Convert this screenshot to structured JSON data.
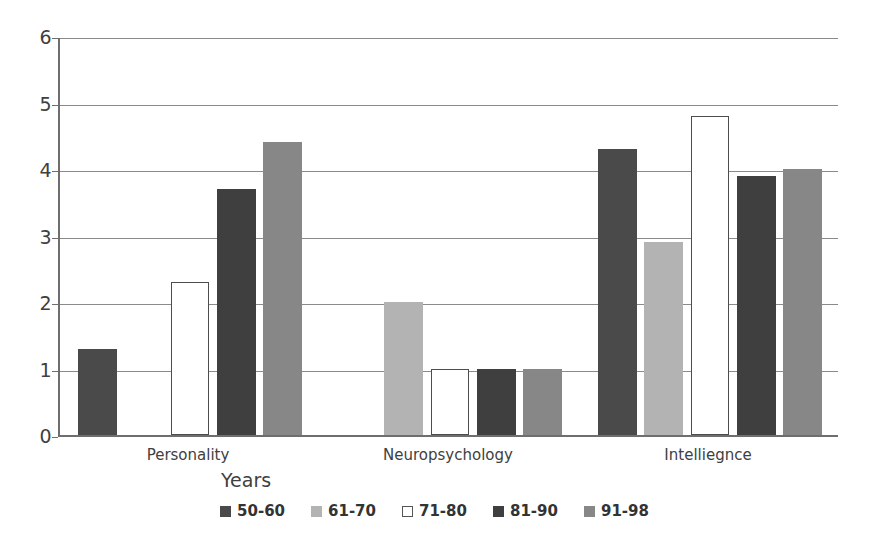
{
  "chart_data": {
    "type": "bar",
    "title": "",
    "subtitle": "",
    "xlabel": "Years",
    "ylabel": "",
    "ylim": [
      0,
      6
    ],
    "y_ticks": [
      0,
      1,
      2,
      3,
      4,
      5,
      6
    ],
    "grid": true,
    "grid_axis": "y",
    "legend_position": "bottom",
    "categories": [
      "Personality",
      "Neuropsychology",
      "Intelliegnce"
    ],
    "series": [
      {
        "name": "50-60",
        "color": "#4a4a4a",
        "style": "filled",
        "values": [
          1.3,
          0,
          4.3
        ]
      },
      {
        "name": "61-70",
        "color": "#b3b3b3",
        "style": "filled",
        "values": [
          0,
          2.0,
          2.9
        ]
      },
      {
        "name": "71-80",
        "color": "#ffffff",
        "style": "outlined",
        "values": [
          2.3,
          1.0,
          4.8
        ]
      },
      {
        "name": "81-90",
        "color": "#3f3f3f",
        "style": "filled",
        "values": [
          3.7,
          1.0,
          3.9
        ]
      },
      {
        "name": "91-98",
        "color": "#878787",
        "style": "filled",
        "values": [
          4.4,
          1.0,
          4.0
        ]
      }
    ]
  },
  "legend": {
    "items": [
      {
        "label": "50-60"
      },
      {
        "label": "61-70"
      },
      {
        "label": "71-80"
      },
      {
        "label": "81-90"
      },
      {
        "label": "91-98"
      }
    ]
  },
  "axis": {
    "x_title": "Years",
    "y_tick_labels": [
      "6",
      "5",
      "4",
      "3",
      "2",
      "1",
      "0"
    ]
  },
  "colors": {
    "axis": "#6e6e6e",
    "gridline": "#8a8a8a",
    "text": "#3f3f3f",
    "background": "#ffffff"
  }
}
